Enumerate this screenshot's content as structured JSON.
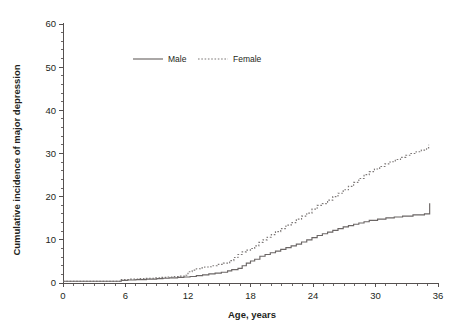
{
  "chart_data": {
    "type": "line",
    "title": "",
    "xlabel": "Age, years",
    "ylabel": "Cumulative incidence of major depression",
    "xlim": [
      0,
      36
    ],
    "ylim": [
      0,
      60
    ],
    "grid": false,
    "legend_position": "top-center",
    "x_ticks": [
      0,
      6,
      12,
      18,
      24,
      30,
      36
    ],
    "x_tick_labels": [
      "0",
      "6",
      "12",
      "18",
      "24",
      "30",
      "36"
    ],
    "x_minor_step": 1,
    "y_ticks": [
      0,
      10,
      20,
      30,
      40,
      50,
      60
    ],
    "y_tick_labels": [
      "0",
      "10",
      "20",
      "30",
      "40",
      "50",
      "60"
    ],
    "y_minor_step": 2,
    "step_style": "post",
    "series": [
      {
        "name": "Male",
        "style": "solid",
        "color": "#6b6665",
        "x": [
          0,
          5.0,
          5.6,
          6.2,
          7.0,
          8.0,
          9.0,
          9.6,
          10.2,
          11.0,
          11.6,
          12.2,
          12.8,
          13.4,
          14.0,
          14.6,
          15.2,
          15.8,
          16.2,
          16.8,
          17.2,
          17.6,
          18.0,
          18.4,
          18.9,
          19.4,
          19.9,
          20.4,
          20.9,
          21.4,
          21.9,
          22.4,
          22.9,
          23.4,
          23.9,
          24.4,
          24.9,
          25.4,
          25.9,
          26.4,
          26.9,
          27.4,
          27.9,
          28.4,
          28.9,
          29.4,
          30.2,
          31.0,
          31.8,
          32.6,
          33.6,
          34.7,
          34.9,
          35.2
        ],
        "y": [
          0.4,
          0.4,
          0.6,
          0.7,
          0.8,
          0.9,
          1.0,
          1.1,
          1.2,
          1.3,
          1.4,
          1.5,
          1.7,
          1.9,
          2.1,
          2.3,
          2.5,
          2.8,
          3.1,
          3.4,
          4.0,
          4.6,
          5.1,
          5.5,
          6.2,
          6.6,
          7.0,
          7.4,
          7.8,
          8.2,
          8.6,
          9.0,
          9.5,
          10.0,
          10.5,
          11.0,
          11.4,
          11.8,
          12.2,
          12.6,
          13.0,
          13.3,
          13.6,
          13.9,
          14.2,
          14.5,
          14.8,
          15.1,
          15.3,
          15.5,
          15.8,
          16.0,
          16.0,
          18.5
        ]
      },
      {
        "name": "Female",
        "style": "dotted",
        "color": "#7d7877",
        "x": [
          0,
          5.0,
          5.6,
          6.4,
          7.2,
          8.0,
          8.8,
          9.4,
          10.0,
          10.6,
          11.2,
          11.8,
          12.0,
          12.4,
          12.8,
          13.2,
          13.6,
          14.2,
          14.8,
          15.4,
          16.0,
          16.4,
          16.8,
          17.2,
          17.6,
          18.0,
          18.4,
          18.8,
          19.2,
          19.6,
          20.0,
          20.4,
          20.9,
          21.4,
          21.9,
          22.4,
          22.9,
          23.4,
          23.9,
          24.4,
          24.9,
          25.4,
          25.9,
          26.4,
          26.9,
          27.4,
          27.9,
          28.4,
          28.9,
          29.4,
          29.9,
          30.4,
          30.9,
          31.4,
          31.9,
          32.4,
          32.9,
          33.4,
          33.9,
          34.4,
          34.9,
          35.1
        ],
        "y": [
          0.4,
          0.4,
          0.8,
          0.9,
          1.0,
          1.1,
          1.2,
          1.3,
          1.4,
          1.5,
          1.6,
          1.8,
          2.6,
          3.0,
          3.3,
          3.5,
          3.7,
          4.0,
          4.3,
          4.6,
          5.2,
          5.9,
          6.6,
          7.2,
          7.6,
          8.0,
          8.6,
          9.4,
          10.0,
          10.6,
          11.2,
          11.9,
          12.6,
          13.4,
          14.0,
          14.8,
          15.5,
          16.2,
          17.1,
          18.0,
          18.4,
          19.2,
          20.0,
          20.8,
          21.6,
          22.4,
          23.3,
          24.2,
          25.1,
          25.8,
          26.4,
          27.0,
          27.6,
          28.1,
          28.6,
          29.1,
          29.6,
          30.0,
          30.4,
          30.8,
          31.3,
          32.0
        ]
      }
    ]
  },
  "legend": {
    "items": [
      {
        "label": "Male"
      },
      {
        "label": "Female"
      }
    ]
  }
}
